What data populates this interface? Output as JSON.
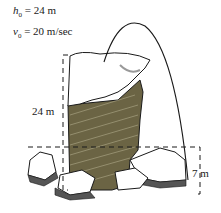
{
  "given": {
    "h0": {
      "symbol": "h",
      "sub": "0",
      "value": "= 24 m"
    },
    "v0": {
      "symbol": "v",
      "sub": "0",
      "value": "= 20 m/sec"
    }
  },
  "dimensions": {
    "cliff_height": "24 m",
    "ledge_height": "7 m"
  },
  "colors": {
    "rock": "#6b6444",
    "snow": "#ffffff",
    "outline": "#1a1a1a"
  }
}
